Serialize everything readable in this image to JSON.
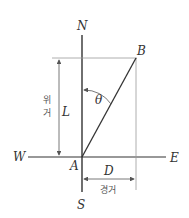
{
  "diagram": {
    "labels": {
      "north": "N",
      "south": "S",
      "west": "W",
      "east": "E",
      "point_a": "A",
      "point_b": "B",
      "angle": "θ",
      "latitude_distance": "L",
      "departure_distance": "D",
      "latitude_kr_1": "위",
      "latitude_kr_2": "거",
      "departure_kr": "경거"
    },
    "colors": {
      "axis": "#333333",
      "guide": "#999999",
      "text": "#333333"
    }
  }
}
